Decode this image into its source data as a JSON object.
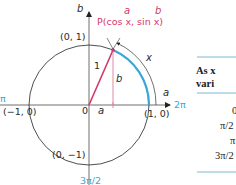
{
  "diagram": {
    "axes": {
      "horizontal_label": "a",
      "vertical_label": "b",
      "origin_label": "0",
      "right_angle_label": "2π",
      "left_angle_label": "π",
      "top_angle_label": "π/2",
      "bottom_angle_label": "3π/2"
    },
    "points": {
      "top": "(0, 1)",
      "left": "(−1, 0)",
      "right": "(1, 0)",
      "bottom": "(0, −1)"
    },
    "point_p": {
      "label": "P(cos x, sin x)",
      "a_annotation": "a",
      "b_annotation": "b"
    },
    "segments": {
      "radius_label": "1",
      "vertical_label": "b",
      "horizontal_label": "a",
      "arc_label": "x"
    },
    "colors": {
      "axis": "#6e6e6e",
      "circle": "#3a3a3a",
      "radius": "#d4386b",
      "projection": "#e07b9c",
      "arc_highlight": "#3aa7d9",
      "angle_label": "#3aa7d9",
      "table_rule": "#7fb8d6"
    }
  },
  "table": {
    "header_line1": "As x",
    "header_line2": "vari",
    "rows": [
      "0",
      "π/2",
      "π",
      "3π/2"
    ]
  }
}
